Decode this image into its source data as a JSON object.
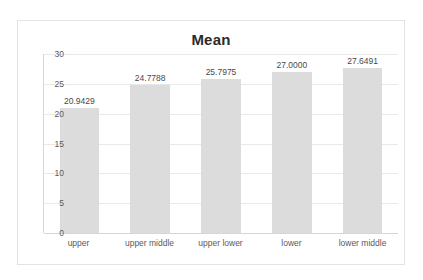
{
  "chart_data": {
    "type": "bar",
    "title": "Mean",
    "xlabel": "",
    "ylabel": "",
    "categories": [
      "upper",
      "upper middle",
      "upper lower",
      "lower",
      "lower middle"
    ],
    "values": [
      20.9429,
      24.7788,
      25.7975,
      27.0,
      27.6491
    ],
    "data_labels": [
      "20.9429",
      "24.7788",
      "25.7975",
      "27.0000",
      "27.6491"
    ],
    "ylim": [
      0,
      30
    ],
    "yticks": [
      30,
      25,
      20,
      15,
      10,
      5,
      0
    ],
    "ytick_labels": [
      "30",
      "25",
      "20",
      "15",
      "10",
      "5",
      "0"
    ],
    "grid": true,
    "grid_axis": "y",
    "legend": false,
    "series": [
      {
        "name": "Mean",
        "values": [
          20.9429,
          24.7788,
          25.7975,
          27.0,
          27.6491
        ]
      }
    ],
    "colors": {
      "bar": "#dcdcdc",
      "gridline": "#e9e9e9",
      "axis": "#d6d6d6",
      "title_text": "#2b2b2b",
      "tick_text": "#5a5a5a",
      "label_text": "#4a4a4a",
      "plot_background": "#ffffff",
      "frame_border": "#e3e3e3"
    }
  }
}
